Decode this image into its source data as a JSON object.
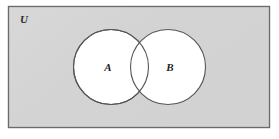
{
  "figure": {
    "name": "venn-diagram-two-sets",
    "type": "venn",
    "universe": {
      "label": "U",
      "fill_color": "#d4d4d4",
      "stroke_color": "#6b6b6b",
      "rect": {
        "x": 8,
        "y": 6,
        "width": 262,
        "height": 122
      }
    },
    "sets": [
      {
        "label": "A",
        "cx": 111,
        "cy": 67,
        "r": 38,
        "fill_color": "#ffffff",
        "stroke_color": "#555555",
        "label_x": 108,
        "label_y": 71
      },
      {
        "label": "B",
        "cx": 168,
        "cy": 67,
        "r": 38,
        "fill_color": "#ffffff",
        "stroke_color": "#555555",
        "label_x": 170,
        "label_y": 71
      }
    ],
    "universe_label_pos": {
      "x": 20,
      "y": 23
    },
    "page_background": "#ffffff"
  }
}
